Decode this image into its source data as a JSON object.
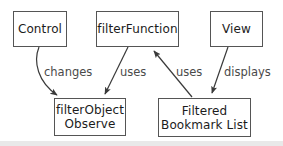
{
  "diagram": {
    "type": "node-edge-diagram",
    "background_color": "#ffffff",
    "node_border_color": "#555555",
    "text_color": "#1c1c1c",
    "label_color": "#4a4a4a",
    "edge_color": "#3a3a3a",
    "nodes": [
      {
        "id": "control",
        "label": "Control"
      },
      {
        "id": "filterfn",
        "label": "filterFunction"
      },
      {
        "id": "view",
        "label": "View"
      },
      {
        "id": "filterobj",
        "label_line1": "filterObject",
        "label_line2": "Observe"
      },
      {
        "id": "bookmarks",
        "label_line1": "Filtered",
        "label_line2": "Bookmark List"
      }
    ],
    "edges": [
      {
        "id": "changes",
        "from": "control",
        "to": "filterobj",
        "label": "changes"
      },
      {
        "id": "uses-1",
        "from": "filterfn",
        "to": "filterobj",
        "label": "uses"
      },
      {
        "id": "uses-2",
        "from": "bookmarks",
        "to": "filterfn",
        "label": "uses"
      },
      {
        "id": "displays",
        "from": "view",
        "to": "bookmarks",
        "label": "displays"
      }
    ]
  }
}
